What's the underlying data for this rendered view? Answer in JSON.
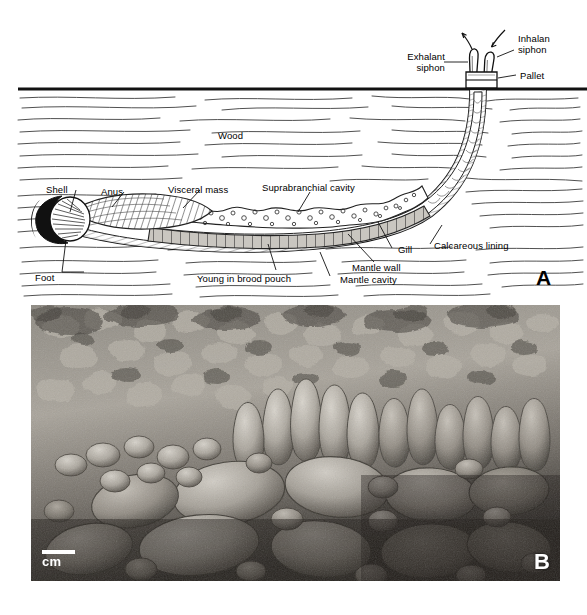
{
  "figure": {
    "panels": [
      {
        "id": "A",
        "letter": "A",
        "type": "line-diagram"
      },
      {
        "id": "B",
        "letter": "B",
        "type": "photograph"
      }
    ]
  },
  "panel_a": {
    "letter": "A",
    "labels": {
      "exhalant_siphon_l1": "Exhalant",
      "exhalant_siphon_l2": "siphon",
      "inhalant_siphon_l1": "Inhalan",
      "inhalant_siphon_l2": "siphon",
      "pallet": "Pallet",
      "wood": "Wood",
      "shell": "Shell",
      "anus": "Anus",
      "visceral_mass": "Visceral mass",
      "suprabranchial_cavity": "Suprabranchial cavity",
      "calcareous_lining": "Calcareous lining",
      "gill": "Gill",
      "mantle_wall": "Mantle wall",
      "mantle_cavity": "Mantle cavity",
      "young_in_brood_pouch": "Young in brood pouch",
      "foot": "Foot"
    }
  },
  "panel_b": {
    "letter": "B",
    "scale_label": "cm"
  },
  "colors": {
    "ink": "#000000",
    "paper": "#ffffff",
    "wood_grain": "#3a3a3a",
    "photo_light": "#d8d4cd",
    "photo_mid": "#8d8880",
    "photo_dark": "#2b2824"
  }
}
